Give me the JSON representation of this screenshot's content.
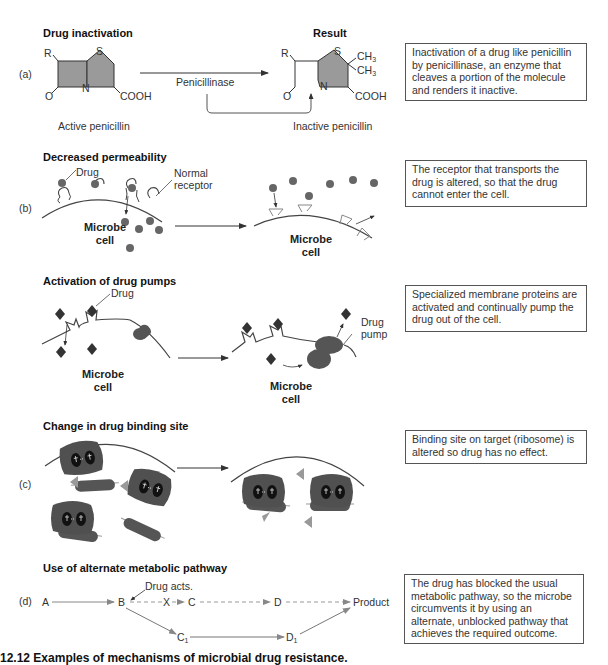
{
  "panels": {
    "a": {
      "letter": "(a)",
      "title": "Drug inactivation",
      "result_title": "Result",
      "enzyme_label": "Penicillinase",
      "left_molecule_label": "Active penicillin",
      "right_molecule_label": "Inactive penicillin",
      "atoms": {
        "r": "R",
        "s": "S",
        "n": "N",
        "o": "O",
        "cooh": "COOH",
        "ch3": "CH",
        "sub3": "3"
      },
      "description": "Inactivation of a drug like penicillin by penicillinase, an enzyme that cleaves a portion of the molecule and renders it inactive."
    },
    "b": {
      "letter": "(b)",
      "title": "Decreased permeability",
      "drug_label": "Drug",
      "receptor_label": "Normal receptor",
      "cell_label": "Microbe cell",
      "description": "The receptor that transports the drug is altered, so that the drug cannot enter the cell."
    },
    "pumps": {
      "title": "Activation of drug pumps",
      "drug_label": "Drug",
      "pump_label": "Drug pump",
      "cell_label": "Microbe cell",
      "description": "Specialized membrane proteins are activated and continually pump the drug out of the cell."
    },
    "c": {
      "letter": "(c)",
      "title": "Change in drug binding site",
      "description": "Binding site on target (ribosome) is altered so drug has no effect."
    },
    "d": {
      "letter": "(d)",
      "title": "Use of alternate metabolic pathway",
      "drug_acts_label": "Drug acts.",
      "nodes": {
        "a": "A",
        "b": "B",
        "x": "X",
        "c": "C",
        "d": "D",
        "product": "Product",
        "c1": "C",
        "d1": "D",
        "sub1": "1"
      },
      "description": "The drug has blocked the usual metabolic pathway, so the microbe circumvents it by using an alternate, unblocked pathway that achieves the required outcome."
    }
  },
  "caption": "12.12   Examples of mechanisms of microbial drug resistance."
}
